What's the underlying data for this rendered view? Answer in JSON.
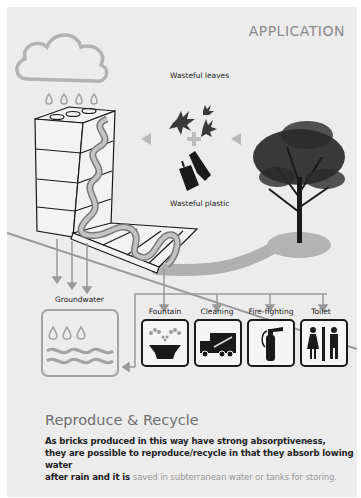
{
  "header": {
    "title": "APPLICATION"
  },
  "inputs": {
    "leaves_label": "Wasteful leaves",
    "plastic_label": "Wasteful plastic"
  },
  "groundwater": {
    "label": "Groundwater"
  },
  "uses": [
    {
      "label": "Fountain",
      "icon": "fountain-icon"
    },
    {
      "label": "Cleaning",
      "icon": "cleaning-truck-icon"
    },
    {
      "label": "Fire-fighting",
      "icon": "fire-extinguisher-icon"
    },
    {
      "label": "Toilet",
      "icon": "toilet-icon"
    }
  ],
  "section": {
    "title": "Reproduce & Recycle",
    "line1": "As bricks produced in this way have strong absorptiveness,",
    "line2": "they are possible to reproduce/recycle in that they absorb lowing water",
    "line3_dark": "after rain and it is ",
    "line3_muted": "saved in subterranean water or tanks for storing."
  },
  "colors": {
    "background": "#ececec",
    "line_gray": "#9a9a9a",
    "icon_dark": "#1a1a1a",
    "title_gray": "#8a8a8a"
  }
}
